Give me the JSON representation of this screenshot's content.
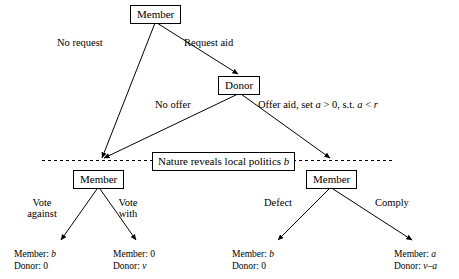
{
  "diagram": {
    "nodes": {
      "root_member": "Member",
      "donor": "Donor",
      "left_member": "Member",
      "right_member": "Member",
      "nature": "Nature reveals local politics b"
    },
    "edges": {
      "no_request": "No request",
      "request_aid": "Request aid",
      "no_offer": "No offer",
      "offer_aid": "Offer aid, set a > 0, s.t. a < r",
      "vote_against_l1": "Vote",
      "vote_against_l2": "against",
      "vote_with_l1": "Vote",
      "vote_with_l2": "with",
      "defect": "Defect",
      "comply": "Comply"
    },
    "payoffs": [
      {
        "name": "vote-against-payoff",
        "member": "Member: b",
        "donor": "Donor: 0"
      },
      {
        "name": "vote-with-payoff",
        "member": "Member: 0",
        "donor": "Donor: v"
      },
      {
        "name": "defect-payoff",
        "member": "Member: b",
        "donor": "Donor: 0"
      },
      {
        "name": "comply-payoff",
        "member": "Member: a",
        "donor": "Donor: v–a"
      }
    ],
    "colors": {
      "line": "#000000",
      "background": "#ffffff",
      "text": "#000000"
    }
  }
}
